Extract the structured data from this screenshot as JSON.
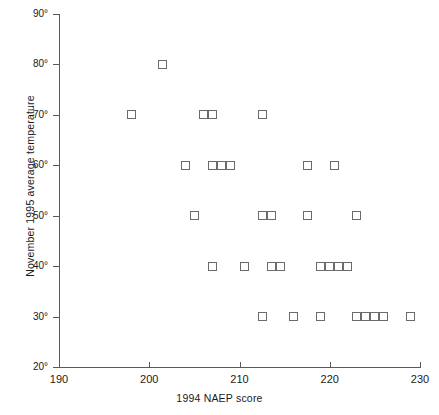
{
  "chart_data": {
    "type": "scatter",
    "title": "",
    "xlabel": "1994 NAEP score",
    "ylabel": "November 1995 average temperature",
    "xlim": [
      190,
      230
    ],
    "ylim": [
      20,
      90
    ],
    "grid": false,
    "legend": null,
    "x_ticks": [
      190,
      200,
      210,
      220,
      230
    ],
    "x_tick_labels": [
      "190",
      "200",
      "210",
      "220",
      "230"
    ],
    "y_ticks": [
      20,
      30,
      40,
      50,
      60,
      70,
      80,
      90
    ],
    "y_tick_labels": [
      "20°",
      "30°",
      "40°",
      "50°",
      "60°",
      "70°",
      "80°",
      "90°"
    ],
    "marker": "open-square",
    "marker_color": "#6b6b6b",
    "points": [
      {
        "x": 201.5,
        "y": 80
      },
      {
        "x": 198,
        "y": 70
      },
      {
        "x": 206,
        "y": 70
      },
      {
        "x": 207,
        "y": 70
      },
      {
        "x": 212.5,
        "y": 70
      },
      {
        "x": 204,
        "y": 60
      },
      {
        "x": 207,
        "y": 60
      },
      {
        "x": 208,
        "y": 60
      },
      {
        "x": 209,
        "y": 60
      },
      {
        "x": 217.5,
        "y": 60
      },
      {
        "x": 220.5,
        "y": 60
      },
      {
        "x": 205,
        "y": 50
      },
      {
        "x": 212.5,
        "y": 50
      },
      {
        "x": 213.5,
        "y": 50
      },
      {
        "x": 217.5,
        "y": 50
      },
      {
        "x": 223,
        "y": 50
      },
      {
        "x": 207,
        "y": 40
      },
      {
        "x": 210.5,
        "y": 40
      },
      {
        "x": 213.5,
        "y": 40
      },
      {
        "x": 214.5,
        "y": 40
      },
      {
        "x": 219,
        "y": 40
      },
      {
        "x": 220,
        "y": 40
      },
      {
        "x": 221,
        "y": 40
      },
      {
        "x": 222,
        "y": 40
      },
      {
        "x": 212.5,
        "y": 30
      },
      {
        "x": 216,
        "y": 30
      },
      {
        "x": 219,
        "y": 30
      },
      {
        "x": 223,
        "y": 30
      },
      {
        "x": 224,
        "y": 30
      },
      {
        "x": 225,
        "y": 30
      },
      {
        "x": 226,
        "y": 30
      },
      {
        "x": 229,
        "y": 30
      }
    ]
  }
}
